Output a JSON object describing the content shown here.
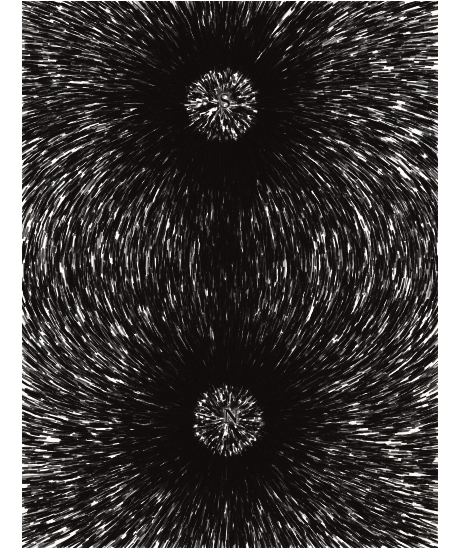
{
  "figure": {
    "medium": "black-and-white photographic halftone",
    "background_color": "#fbfaf8",
    "filing_color": "#120f0e",
    "width": 455,
    "height": 560
  },
  "plate": {
    "left": 22,
    "top": 1,
    "width": 416,
    "height": 547,
    "margin_color": "#ffffff"
  },
  "poles": [
    {
      "label": "S",
      "name": "south-pole",
      "position_x": 222,
      "position_y": 105,
      "halo_radius": 44,
      "description": "upper pole, bright cleared halo with scattered filing specks"
    },
    {
      "label": "N",
      "name": "north-pole",
      "position_x": 228,
      "position_y": 420,
      "halo_radius": 42,
      "description": "lower pole, bright cleared halo with scattered filing specks"
    }
  ],
  "magnet": {
    "axis": "vertical",
    "center_x": 226,
    "center_y": 262,
    "top_y": 105,
    "bottom_y": 420,
    "dark_core_x": 228,
    "dark_core_y": 253,
    "description": "dense dark cluster of filings along the magnet body between the poles"
  },
  "field": {
    "type": "magnetic-dipole",
    "line_count": 760,
    "streak_length_min": 5,
    "streak_length_max": 17,
    "dipole_strength": 30000,
    "description": "iron filings align tangent to dipole field lines, radiating from both poles and arcing around the sides"
  },
  "chart_data": {
    "type": "scatter",
    "xlabel": "",
    "ylabel": "",
    "annotations": [
      "S",
      "N"
    ],
    "series": [
      {
        "name": "south-pole-marker",
        "x": [
          222
        ],
        "y": [
          105
        ]
      },
      {
        "name": "north-pole-marker",
        "x": [
          228
        ],
        "y": [
          420
        ]
      },
      {
        "name": "magnet-core",
        "x": [
          228
        ],
        "y": [
          253
        ]
      }
    ],
    "xlim": [
      0,
      455
    ],
    "ylim": [
      0,
      560
    ],
    "grid": false,
    "legend": "none"
  }
}
